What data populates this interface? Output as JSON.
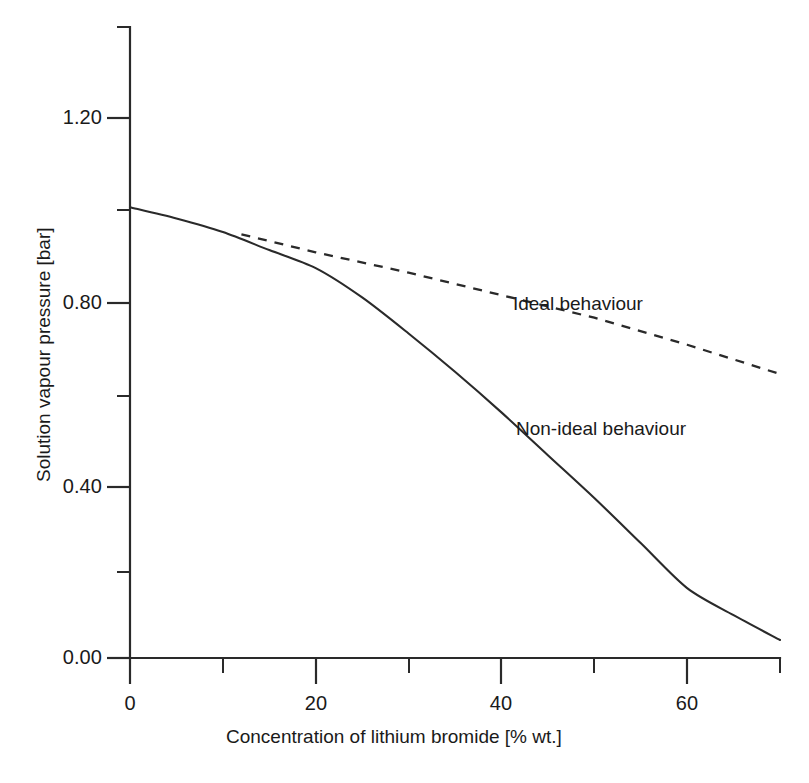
{
  "chart_data": {
    "type": "line",
    "title": "",
    "xlabel": "Concentration of lithium bromide [% wt.]",
    "ylabel": "Solution vapour pressure [bar]",
    "xlim": [
      0,
      70
    ],
    "ylim": [
      0.0,
      1.4
    ],
    "grid": false,
    "legend_position": "inline-annotations",
    "x_ticks_major": [
      {
        "value": 0,
        "label": "0"
      },
      {
        "value": 20,
        "label": "20"
      },
      {
        "value": 40,
        "label": "40"
      },
      {
        "value": 60,
        "label": "60"
      }
    ],
    "x_ticks_minor": [
      10,
      30,
      50,
      70
    ],
    "y_ticks_major": [
      {
        "value": 0.0,
        "label": "0.00"
      },
      {
        "value": 0.4,
        "label": "0.40"
      },
      {
        "value": 0.8,
        "label": "0.80"
      },
      {
        "value": 1.2,
        "label": "1.20"
      }
    ],
    "y_ticks_minor": [
      0.2,
      0.6,
      1.0,
      1.4
    ],
    "series": [
      {
        "name": "Ideal behaviour",
        "style": "dashed",
        "color": "#2a2a2a",
        "label_x": 45,
        "label_y": 0.8,
        "x": [
          12,
          20,
          30,
          40,
          50,
          60,
          70
        ],
        "y": [
          0.94,
          0.9,
          0.855,
          0.805,
          0.755,
          0.695,
          0.63
        ]
      },
      {
        "name": "Non-ideal behaviour",
        "style": "solid",
        "color": "#2a2a2a",
        "label_x": 42,
        "label_y": 0.5,
        "x": [
          0,
          5,
          10,
          15,
          20,
          25,
          30,
          35,
          40,
          45,
          50,
          55,
          60,
          65,
          70
        ],
        "y": [
          1.0,
          0.975,
          0.945,
          0.905,
          0.865,
          0.8,
          0.72,
          0.635,
          0.545,
          0.45,
          0.355,
          0.255,
          0.155,
          0.095,
          0.04
        ]
      }
    ],
    "annotations": [
      {
        "text": "Ideal behaviour",
        "x": 45,
        "y": 0.8
      },
      {
        "text": "Non-ideal behaviour",
        "x": 42,
        "y": 0.5
      }
    ]
  },
  "axes": {
    "y_tick_labels": [
      "1.20",
      "0.80",
      "0.40",
      "0.00"
    ],
    "x_tick_labels": [
      "0",
      "20",
      "40",
      "60"
    ],
    "x_title": "Concentration of lithium bromide [% wt.]",
    "y_title": "Solution vapour pressure [bar]"
  },
  "labels": {
    "ideal": "Ideal behaviour",
    "nonideal": "Non-ideal behaviour"
  }
}
